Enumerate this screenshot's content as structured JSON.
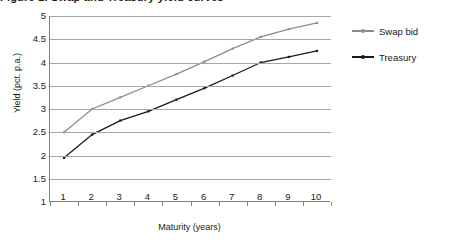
{
  "chart_data": {
    "type": "line",
    "title": "Figure 1. Swap and Treasury yield curves",
    "xlabel": "Maturity (years)",
    "ylabel": "Yield (pct. p.a.)",
    "categories": [
      1,
      2,
      3,
      4,
      5,
      6,
      7,
      8,
      9,
      10
    ],
    "x_tick_labels": [
      "1",
      "2",
      "3",
      "4",
      "5",
      "6",
      "7",
      "8",
      "9",
      "10"
    ],
    "y_tick_labels": [
      "1",
      "1.5",
      "2",
      "2.5",
      "3",
      "3.5",
      "4",
      "4.5",
      "5"
    ],
    "y_ticks": [
      1,
      1.5,
      2,
      2.5,
      3,
      3.5,
      4,
      4.5,
      5
    ],
    "ylim": [
      1,
      5
    ],
    "grid": "horizontal",
    "legend_position": "right",
    "series": [
      {
        "name": "Swap bid",
        "color": "#8c8c8c",
        "values": [
          2.5,
          3.0,
          3.25,
          3.5,
          3.75,
          4.02,
          4.3,
          4.55,
          4.72,
          4.85
        ]
      },
      {
        "name": "Treasury",
        "color": "#1a1a1a",
        "values": [
          1.95,
          2.45,
          2.75,
          2.95,
          3.2,
          3.45,
          3.72,
          4.0,
          4.12,
          4.25
        ]
      }
    ]
  },
  "legend": {
    "entries": [
      {
        "label": "Swap bid"
      },
      {
        "label": "Treasury"
      }
    ]
  }
}
